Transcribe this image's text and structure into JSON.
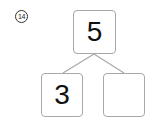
{
  "problem": {
    "number_label": "⑭"
  },
  "diagram": {
    "type": "number-bond",
    "whole": "5",
    "parts": [
      "3",
      ""
    ],
    "line_color": "#a8a8a8"
  }
}
